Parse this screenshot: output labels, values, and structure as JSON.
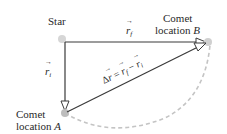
{
  "diagram": {
    "type": "vector-displacement",
    "labels": {
      "star": "Star",
      "r_final": {
        "symbol": "r",
        "subscript": "f",
        "arrow": "→"
      },
      "r_initial": {
        "symbol": "r",
        "subscript": "i",
        "arrow": "→"
      },
      "location_a": {
        "line1": "Comet",
        "line2_prefix": "location ",
        "line2_var": "A"
      },
      "location_b": {
        "line1": "Comet",
        "line2_prefix": "location ",
        "line2_var": "B"
      },
      "delta_r": {
        "delta": "Δ",
        "lhs": "r",
        "eq": " = ",
        "rhs1": "r",
        "rhs1_sub": "f",
        "minus": " − ",
        "rhs2": "r",
        "rhs2_sub": "i",
        "arrow": "→"
      }
    },
    "points": {
      "star": {
        "x": 62,
        "y": 39
      },
      "origin": {
        "x": 65,
        "y": 42
      },
      "A": {
        "x": 65,
        "y": 113
      },
      "B": {
        "x": 208,
        "y": 42
      }
    },
    "colors": {
      "line": "#3a3a3a",
      "arrowhead_fill": "#ffffff",
      "dot": "#cfcfcf",
      "orbit_dash": "#c4c4c4",
      "text": "#2a2a2a"
    }
  }
}
